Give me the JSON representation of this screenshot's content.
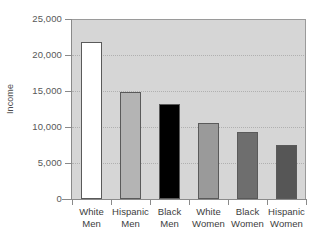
{
  "chart_data": {
    "type": "bar",
    "title": "",
    "xlabel": "",
    "ylabel": "Income",
    "ylim": [
      0,
      25000
    ],
    "yticks": [
      0,
      5000,
      10000,
      15000,
      20000,
      25000
    ],
    "ytick_labels": [
      "0",
      "5,000",
      "10,000",
      "15,000",
      "20,000",
      "25,000"
    ],
    "grid": true,
    "legend": "none",
    "categories": [
      "White Men",
      "Hispanic Men",
      "Black Men",
      "White Women",
      "Black Women",
      "Hispanic Women"
    ],
    "category_lines": [
      [
        "White",
        "Men"
      ],
      [
        "Hispanic",
        "Men"
      ],
      [
        "Black",
        "Men"
      ],
      [
        "White",
        "Women"
      ],
      [
        "Black",
        "Women"
      ],
      [
        "Hispanic",
        "Women"
      ]
    ],
    "values": [
      21800,
      14800,
      13200,
      10500,
      9300,
      7500
    ],
    "bar_colors": [
      "#ffffff",
      "#b4b4b4",
      "#000000",
      "#9a9a9a",
      "#6e6e6e",
      "#565656"
    ],
    "bar_edge_color": "#5a5a5a",
    "plot_background": "#d6d6d6",
    "gridline_color": "#b0b0b0",
    "axis_color": "#8a8a8a"
  }
}
